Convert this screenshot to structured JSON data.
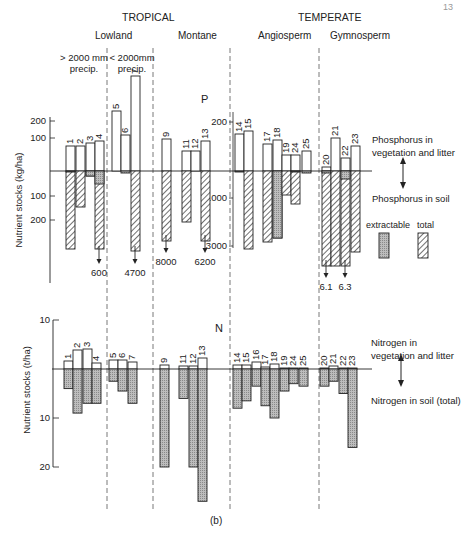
{
  "page_number": "13",
  "caption": "(b)",
  "headers": {
    "tropical": "TROPICAL",
    "temperate": "TEMPERATE",
    "lowland": "Lowland",
    "montane": "Montane",
    "angiosperm": "Angiosperm",
    "gymnosperm": "Gymnosperm",
    "wet_precip": "> 2000 mm precip.",
    "dry_precip": "< 2000mm precip."
  },
  "legend": {
    "p_veg": "Phosphorus in vegetation and litter",
    "p_soil": "Phosphorus in soil",
    "extractable": "extractable",
    "total": "total",
    "n_veg": "Nitrogen in vegetation and litter",
    "n_soil": "Nitrogen in soil (total)"
  },
  "chart_data": [
    {
      "type": "bar",
      "title": "P",
      "ylabel": "Nutrient stocks (kg/ha)",
      "left_axis_ticks_above": [
        "100",
        "200"
      ],
      "left_axis_ticks_below": [
        "100",
        "200"
      ],
      "temperate_axis_ticks_above": [
        "200"
      ],
      "temperate_axis_ticks_below": [
        "1000",
        "3000"
      ],
      "offscale_labels": [
        {
          "site": "4",
          "value": "600"
        },
        {
          "site": "7",
          "value": "4700"
        },
        {
          "site": "9",
          "value": "8000"
        },
        {
          "site": "13",
          "value": "6200"
        },
        {
          "site": "20",
          "value": "6.1"
        },
        {
          "site": "22",
          "value": "6.3"
        }
      ],
      "categories": [
        "1",
        "2",
        "3",
        "4",
        "5",
        "6",
        "7",
        "9",
        "11",
        "12",
        "13",
        "14",
        "15",
        "17",
        "18",
        "19",
        "24",
        "25",
        "20",
        "21",
        "22",
        "23"
      ],
      "series": [
        {
          "name": "Phosphorus in vegetation and litter (kg/ha)",
          "values": [
            70,
            70,
            80,
            90,
            250,
            130,
            650,
            95,
            60,
            60,
            90,
            120,
            140,
            100,
            115,
            70,
            70,
            80,
            10,
            140,
            60,
            90
          ]
        },
        {
          "name": "Phosphorus in soil, extractable (kg/ha)",
          "values": [
            3,
            0,
            15,
            50,
            0,
            5,
            0,
            0,
            0,
            0,
            0,
            5,
            0,
            0,
            2500,
            0,
            5,
            10,
            10,
            0,
            50,
            0
          ]
        },
        {
          "name": "Phosphorus in soil, total (kg/ha)",
          "values": [
            310,
            145,
            15,
            310,
            0,
            0,
            4700,
            8000,
            205,
            0,
            6200,
            0,
            3000,
            2800,
            0,
            1000,
            1300,
            0,
            6100,
            6300,
            6300,
            2200
          ]
        }
      ]
    },
    {
      "type": "bar",
      "title": "N",
      "ylabel": "Nutrient stocks (t/ha)",
      "left_axis_ticks_above": [
        "10"
      ],
      "left_axis_ticks_below": [
        "10",
        "20"
      ],
      "categories": [
        "1",
        "2",
        "3",
        "4",
        "5",
        "6",
        "7",
        "9",
        "11",
        "12",
        "13",
        "14",
        "15",
        "16",
        "17",
        "18",
        "19",
        "24",
        "25",
        "20",
        "21",
        "22",
        "23"
      ],
      "series": [
        {
          "name": "Nitrogen in vegetation and litter (t/ha)",
          "values": [
            1.5,
            4,
            4,
            1,
            1.5,
            1.5,
            1,
            0.6,
            0.5,
            0.5,
            1.5,
            0.5,
            0.5,
            1,
            0.3,
            0.5,
            0,
            0,
            0,
            0,
            0.2,
            0,
            0
          ]
        },
        {
          "name": "Nitrogen in soil, total (t/ha)",
          "values": [
            4,
            9,
            7,
            7,
            2.5,
            4.5,
            7,
            20,
            6,
            20,
            27,
            8,
            6.5,
            3.5,
            7.5,
            10,
            4.5,
            3,
            3.5,
            3.5,
            2.5,
            5,
            16
          ]
        }
      ]
    }
  ]
}
